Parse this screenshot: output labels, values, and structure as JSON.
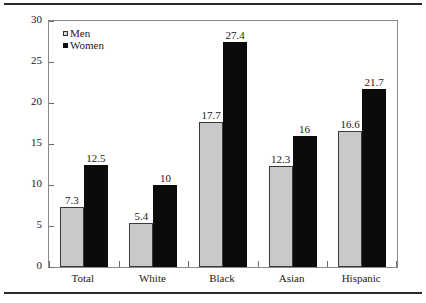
{
  "chart_data": {
    "type": "bar",
    "title": "",
    "subtitle": "",
    "xlabel": "",
    "ylabel": "Percentage",
    "categories": [
      "Total",
      "White",
      "Black",
      "Asian",
      "Hispanic"
    ],
    "series": [
      {
        "name": "Men",
        "color": "#c9c9c9",
        "values": [
          7.3,
          5.4,
          17.7,
          12.3,
          16.6
        ]
      },
      {
        "name": "Women",
        "color": "#0b0b0b",
        "values": [
          12.5,
          10,
          27.4,
          16,
          21.7
        ]
      }
    ],
    "value_labels": [
      [
        "7.3",
        "12.5"
      ],
      [
        "5.4",
        "10"
      ],
      [
        "17.7",
        "27.4"
      ],
      [
        "12.3",
        "16"
      ],
      [
        "16.6",
        "21.7"
      ]
    ],
    "ylim": [
      0,
      30
    ],
    "ytick_values": [
      0,
      5,
      10,
      15,
      20,
      25,
      30
    ],
    "ytick_labels": [
      "0",
      "5",
      "10",
      "15",
      "20",
      "25",
      "30"
    ],
    "grid": false,
    "legend_position": "top-left"
  }
}
